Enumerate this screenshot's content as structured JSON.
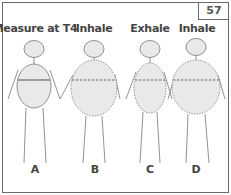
{
  "page_number": "57",
  "figures": [
    {
      "id": "A",
      "label": "Measure at T4",
      "letter": "A",
      "state": "measure",
      "line": "solid"
    },
    {
      "id": "B",
      "label": "Inhale",
      "letter": "B",
      "state": "inhale",
      "line": "dashed"
    },
    {
      "id": "C",
      "label": "Exhale",
      "letter": "C",
      "state": "exhale",
      "line": "dashed"
    },
    {
      "id": "D",
      "label": "Inhale",
      "letter": "D",
      "state": "inhale",
      "line": "dashed"
    }
  ],
  "colors": {
    "fill": "#e9e9e9",
    "stroke": "#777777",
    "border": "#6a6a6a",
    "text": "#444444"
  }
}
